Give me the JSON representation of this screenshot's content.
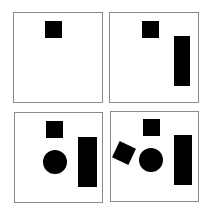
{
  "figure": {
    "panels": [
      {
        "id": "panel-1",
        "box": {
          "x": 13,
          "y": 12,
          "w": 90,
          "h": 91
        },
        "shapes": [
          {
            "type": "square",
            "x": 45,
            "y": 21,
            "w": 17,
            "h": 17,
            "rotate": 0
          }
        ]
      },
      {
        "id": "panel-2",
        "box": {
          "x": 109,
          "y": 12,
          "w": 90,
          "h": 91
        },
        "shapes": [
          {
            "type": "square",
            "x": 142,
            "y": 21,
            "w": 17,
            "h": 17,
            "rotate": 0
          },
          {
            "type": "rectangle",
            "x": 174,
            "y": 36,
            "w": 16,
            "h": 50,
            "rotate": 0
          }
        ]
      },
      {
        "id": "panel-3",
        "box": {
          "x": 14,
          "y": 112,
          "w": 89,
          "h": 91
        },
        "shapes": [
          {
            "type": "square",
            "x": 46,
            "y": 121,
            "w": 17,
            "h": 17,
            "rotate": 0
          },
          {
            "type": "circle",
            "x": 43,
            "y": 150,
            "w": 24,
            "h": 24,
            "rotate": 0
          },
          {
            "type": "rectangle",
            "x": 78,
            "y": 137,
            "w": 19,
            "h": 50,
            "rotate": 0
          }
        ]
      },
      {
        "id": "panel-4",
        "box": {
          "x": 110,
          "y": 111,
          "w": 89,
          "h": 91
        },
        "shapes": [
          {
            "type": "square",
            "x": 143,
            "y": 119,
            "w": 17,
            "h": 17,
            "rotate": 0
          },
          {
            "type": "square",
            "x": 115,
            "y": 144,
            "w": 18,
            "h": 18,
            "rotate": 25
          },
          {
            "type": "circle",
            "x": 139,
            "y": 148,
            "w": 24,
            "h": 24,
            "rotate": 0
          },
          {
            "type": "rectangle",
            "x": 174,
            "y": 135,
            "w": 18,
            "h": 50,
            "rotate": 0
          }
        ]
      }
    ],
    "colors": {
      "shape": "#000000",
      "border": "#8a8a8a",
      "background": "#ffffff"
    }
  }
}
